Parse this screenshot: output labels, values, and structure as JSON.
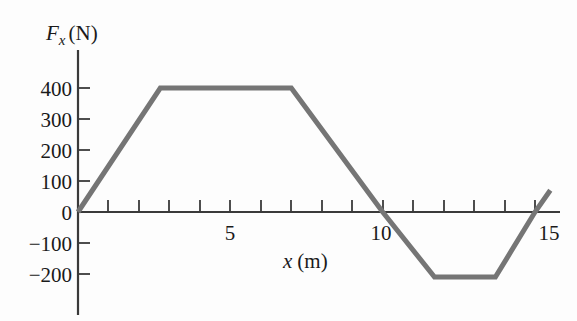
{
  "figure": {
    "name": "force-vs-position-graph",
    "background_color": "#fdfdfd",
    "line_color": "#757575",
    "axis_color": "#3a3a3a"
  },
  "axes": {
    "y_title_symbol": "F",
    "y_title_subscript": "x",
    "y_title_unit": "(N)",
    "y_title_full": "Fx (N)",
    "x_title_symbol": "x",
    "x_title_unit": "(m)",
    "x_title_full": "x (m)",
    "y_ticks": [
      {
        "value": 400,
        "label": "400"
      },
      {
        "value": 300,
        "label": "300"
      },
      {
        "value": 200,
        "label": "200"
      },
      {
        "value": 100,
        "label": "100"
      },
      {
        "value": 0,
        "label": "0"
      },
      {
        "value": -100,
        "label": "−100"
      },
      {
        "value": -200,
        "label": "−200"
      }
    ],
    "x_ticks_labeled": [
      {
        "value": 5,
        "label": "5"
      },
      {
        "value": 10,
        "label": "10"
      },
      {
        "value": 15,
        "label": "15"
      }
    ],
    "x_ticks_all": [
      1,
      2,
      3,
      4,
      5,
      6,
      7,
      8,
      9,
      10,
      11,
      12,
      13,
      14,
      15
    ]
  },
  "chart_data": {
    "type": "line",
    "title": "",
    "subtitle": "",
    "xlabel": "x (m)",
    "ylabel": "Fx (N)",
    "xlim": [
      0,
      16
    ],
    "ylim": [
      -300,
      450
    ],
    "grid": false,
    "legend": null,
    "series": [
      {
        "name": "Fx",
        "color": "#757575",
        "x": [
          0,
          2.7,
          7.0,
          10.0,
          11.7,
          13.7,
          15.0,
          15.5
        ],
        "y": [
          0,
          400,
          400,
          0,
          -210,
          -210,
          0,
          70
        ]
      }
    ],
    "annotations": [],
    "x_tick_labels": [
      "5",
      "10",
      "15"
    ],
    "y_tick_labels": [
      "400",
      "300",
      "200",
      "100",
      "0",
      "-100",
      "-200"
    ]
  }
}
